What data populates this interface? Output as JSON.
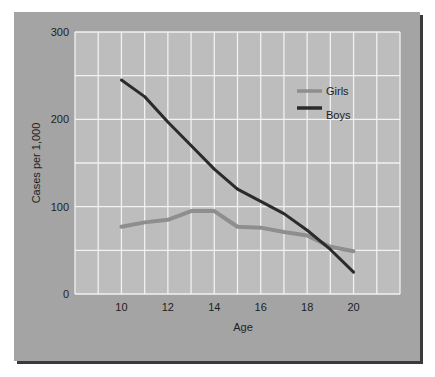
{
  "chart_data": {
    "type": "line",
    "title": "",
    "xlabel": "Age",
    "ylabel": "Cases per 1,000",
    "x": [
      10,
      11,
      12,
      13,
      14,
      15,
      16,
      17,
      18,
      19,
      20
    ],
    "series": [
      {
        "name": "Girls",
        "color": "#8e8e8e",
        "values": [
          77,
          82,
          85,
          95,
          95,
          77,
          76,
          71,
          67,
          54,
          49
        ]
      },
      {
        "name": "Boys",
        "color": "#2b2b2b",
        "values": [
          245,
          226,
          197,
          170,
          143,
          120,
          106,
          92,
          73,
          51,
          25
        ]
      }
    ],
    "xlim": [
      8,
      22
    ],
    "ylim": [
      0,
      300
    ],
    "xticks": [
      "10",
      "12",
      "14",
      "16",
      "18",
      "20"
    ],
    "yticks": [
      "0",
      "100",
      "200",
      "300"
    ],
    "grid": true,
    "legend_position": "upper right inside plot"
  },
  "colors": {
    "panel": "#a4a4a4",
    "plot_area": "#bdbdbd",
    "grid": "#f2f2f2",
    "shadow": "#3a3a3a"
  }
}
